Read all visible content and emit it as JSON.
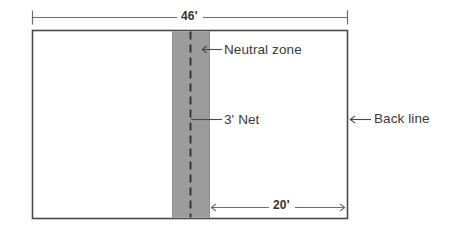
{
  "diagram": {
    "type": "court-plan",
    "colors": {
      "background": "#ffffff",
      "court_fill": "#ffffff",
      "court_outline": "#4a4a4a",
      "neutral_zone_fill": "#9c9c9c",
      "net_line": "#2e2e2e",
      "dimension_line": "#6e6e6e",
      "text": "#3a3a3a"
    },
    "court": {
      "name": "court-outline",
      "outline_color": "#4a4a4a",
      "fill": "#ffffff"
    },
    "neutral_zone": {
      "name": "neutral-zone-band",
      "fill": "#9c9c9c",
      "label": "Neutral zone"
    },
    "net": {
      "name": "net-center-line",
      "style": "dashed",
      "label": "3' Net",
      "width": "3'"
    },
    "back_line": {
      "name": "back-line",
      "label": "Back line"
    },
    "dimensions": [
      {
        "name": "overall-width",
        "label": "46'",
        "value": 46,
        "unit": "feet",
        "position": "top",
        "style": "tick-ends"
      },
      {
        "name": "half-court-depth",
        "label": "20'",
        "value": 20,
        "unit": "feet",
        "position": "bottom-right",
        "style": "arrow-ends"
      }
    ],
    "callouts": [
      {
        "name": "callout-neutral-zone",
        "label": "Neutral zone",
        "arrow": "left"
      },
      {
        "name": "callout-net",
        "label": "3' Net",
        "arrow": "none"
      },
      {
        "name": "callout-back-line",
        "label": "Back line",
        "arrow": "left"
      }
    ]
  }
}
